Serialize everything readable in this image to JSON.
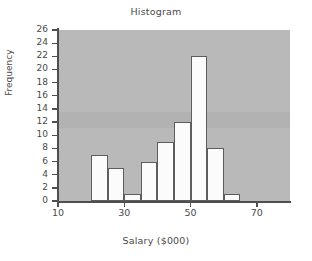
{
  "chart_data": {
    "type": "bar",
    "title": "Histogram",
    "xlabel": "Salary ($000)",
    "ylabel": "Frequency",
    "bin_width": 5,
    "bin_starts": [
      10,
      15,
      20,
      25,
      30,
      35,
      40,
      45,
      50,
      55,
      60,
      65,
      70,
      75
    ],
    "categories": [
      "10-15",
      "15-20",
      "20-25",
      "25-30",
      "30-35",
      "35-40",
      "40-45",
      "45-50",
      "50-55",
      "55-60",
      "60-65",
      "65-70",
      "70-75",
      "75-80"
    ],
    "values": [
      0,
      0,
      7,
      5,
      1,
      6,
      9,
      12,
      22,
      8,
      1,
      0,
      0,
      0
    ],
    "xlim": [
      10,
      80
    ],
    "ylim": [
      0,
      26
    ],
    "xticks": [
      10,
      30,
      50,
      70
    ],
    "xtick_labels": [
      "10",
      "30",
      "50",
      "70"
    ],
    "yticks": [
      0,
      2,
      4,
      6,
      8,
      10,
      12,
      14,
      16,
      18,
      20,
      22,
      24,
      26
    ],
    "ytick_labels": [
      "0",
      "2",
      "4",
      "6",
      "8",
      "10",
      "12",
      "14",
      "16",
      "18",
      "20",
      "22",
      "24",
      "26"
    ],
    "grid": false,
    "legend": null,
    "plot_background_color": "#b9b9b9",
    "bar_fill_color": "#fbfbfb",
    "bar_edge_color": "#5d5d5d",
    "axis_color": "#4f4f4f",
    "text_color": "#4a4a4a"
  }
}
